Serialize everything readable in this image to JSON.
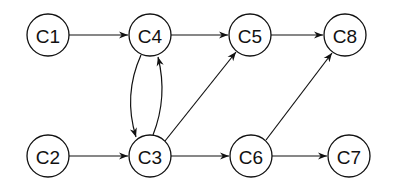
{
  "diagram": {
    "type": "directed-graph",
    "nodes": [
      {
        "id": "C1",
        "label": "C1",
        "x": 48,
        "y": 35
      },
      {
        "id": "C4",
        "label": "C4",
        "x": 150,
        "y": 35
      },
      {
        "id": "C5",
        "label": "C5",
        "x": 250,
        "y": 35
      },
      {
        "id": "C8",
        "label": "C8",
        "x": 345,
        "y": 35
      },
      {
        "id": "C2",
        "label": "C2",
        "x": 48,
        "y": 156
      },
      {
        "id": "C3",
        "label": "C3",
        "x": 150,
        "y": 156
      },
      {
        "id": "C6",
        "label": "C6",
        "x": 251,
        "y": 156
      },
      {
        "id": "C7",
        "label": "C7",
        "x": 349,
        "y": 156
      }
    ],
    "edges": [
      {
        "from": "C1",
        "to": "C4"
      },
      {
        "from": "C4",
        "to": "C5"
      },
      {
        "from": "C5",
        "to": "C8"
      },
      {
        "from": "C4",
        "to": "C3",
        "curved": "left"
      },
      {
        "from": "C3",
        "to": "C4",
        "curved": "right"
      },
      {
        "from": "C2",
        "to": "C3"
      },
      {
        "from": "C3",
        "to": "C5"
      },
      {
        "from": "C3",
        "to": "C6"
      },
      {
        "from": "C6",
        "to": "C8"
      },
      {
        "from": "C6",
        "to": "C7"
      }
    ]
  }
}
